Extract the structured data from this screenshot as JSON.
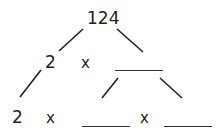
{
  "diagram": {
    "type": "factor-tree",
    "root": "124",
    "level1": {
      "left": "2",
      "op": "x",
      "right": ""
    },
    "level2": {
      "first": "2",
      "op1": "x",
      "second": "",
      "op2": "x",
      "third": ""
    }
  }
}
